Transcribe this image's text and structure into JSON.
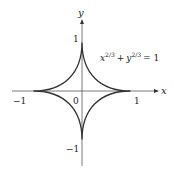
{
  "figure": {
    "equation": {
      "base_x": "x",
      "exp": "2/3",
      "plus": "+",
      "base_y": "y",
      "exp2": "2/3",
      "rhs": "= 1"
    },
    "axes": {
      "x_label": "x",
      "y_label": "y"
    },
    "ticks": {
      "x_neg": "−1",
      "x_zero": "0",
      "x_pos": "1",
      "y_pos": "1",
      "y_neg": "−1"
    },
    "curve": "astroid",
    "colors": {
      "curve": "#333333",
      "axis": "#555555"
    }
  }
}
